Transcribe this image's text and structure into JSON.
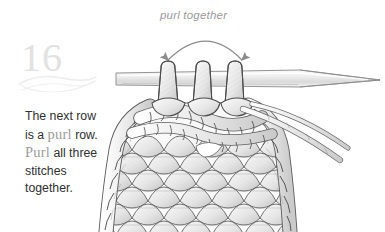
{
  "page": {
    "background_color": "#ffffff",
    "width": 385,
    "height": 232
  },
  "step": {
    "number": "16",
    "number_color": "#e2e2e2",
    "flourish": "swash-ornament"
  },
  "callout": {
    "label": "purl together",
    "label_color": "#9a9a9a",
    "arrow": "double-headed-arc-arrow-down",
    "arrow_color": "#8c8c8c"
  },
  "instruction": {
    "lines": [
      {
        "segments": [
          {
            "text": "The next row",
            "style": "normal"
          }
        ]
      },
      {
        "segments": [
          {
            "text": "is a ",
            "style": "normal"
          },
          {
            "text": "purl",
            "style": "emphasis"
          },
          {
            "text": " row.",
            "style": "normal"
          }
        ]
      },
      {
        "segments": [
          {
            "text": "Purl",
            "style": "emphasis"
          },
          {
            "text": " all three",
            "style": "normal"
          }
        ]
      },
      {
        "segments": [
          {
            "text": "stitches",
            "style": "normal"
          }
        ]
      },
      {
        "segments": [
          {
            "text": "together.",
            "style": "normal"
          }
        ]
      }
    ],
    "full_text": "The next row is a purl row. Purl all three stitches together.",
    "text_color": "#2f2f2f",
    "emphasis_color": "#9b9b9b"
  },
  "illustration": {
    "subject": "knitting-purl-three-together-diagram",
    "needle": {
      "name": "knitting-needle",
      "orientation": "horizontal-tapered-right",
      "fill": "#f3f3f3",
      "stroke": "#8f8f8f"
    },
    "stitches_on_needle": {
      "count": 3,
      "label": "three-stitch-loops"
    },
    "fabric": {
      "name": "knitted-fabric",
      "stitch_fill": "#f2f2f2",
      "stitch_stroke": "#585858",
      "rows": 6
    },
    "yarn_strand": {
      "name": "working-yarn-tail",
      "direction": "to-lower-right"
    }
  }
}
